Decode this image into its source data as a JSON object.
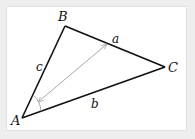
{
  "diagram": {
    "type": "triangle",
    "vertices": {
      "A": {
        "label": "A",
        "x": 22,
        "y": 118
      },
      "B": {
        "label": "B",
        "x": 65,
        "y": 26
      },
      "C": {
        "label": "C",
        "x": 165,
        "y": 67
      }
    },
    "sides": {
      "a": {
        "label": "a",
        "from": "B",
        "to": "C"
      },
      "b": {
        "label": "b",
        "from": "A",
        "to": "C"
      },
      "c": {
        "label": "c",
        "from": "A",
        "to": "B"
      }
    },
    "annotations": {
      "double_arrow": {
        "from": [
          38,
          102
        ],
        "to": [
          107,
          44
        ],
        "color": "#aaaaaa",
        "description": "from angle A to side a"
      },
      "angle_arc": {
        "at": "A",
        "color": "#aaaaaa"
      }
    },
    "colors": {
      "edges": "#111111",
      "annotation": "#aaaaaa",
      "panel": "#ffffff",
      "background": "#eeeeee"
    }
  }
}
